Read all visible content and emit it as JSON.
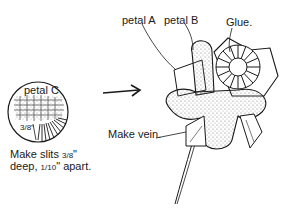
{
  "diagram": {
    "labels": {
      "petal_a": "petal A",
      "petal_b": "petal B",
      "glue": "Glue.",
      "petal_c": "petal C",
      "make_vein": "Make vein.",
      "slit_measure": "3/8\""
    },
    "caption": {
      "line1_prefix": "Make slits ",
      "line1_frac": "3/8",
      "line1_suffix": "\"",
      "line2_prefix": "deep, ",
      "line2_frac": "1/10",
      "line2_suffix": "\" apart."
    },
    "colors": {
      "ink": "#1a1a1a",
      "shading": "#8a8a8a",
      "background": "#ffffff"
    }
  }
}
